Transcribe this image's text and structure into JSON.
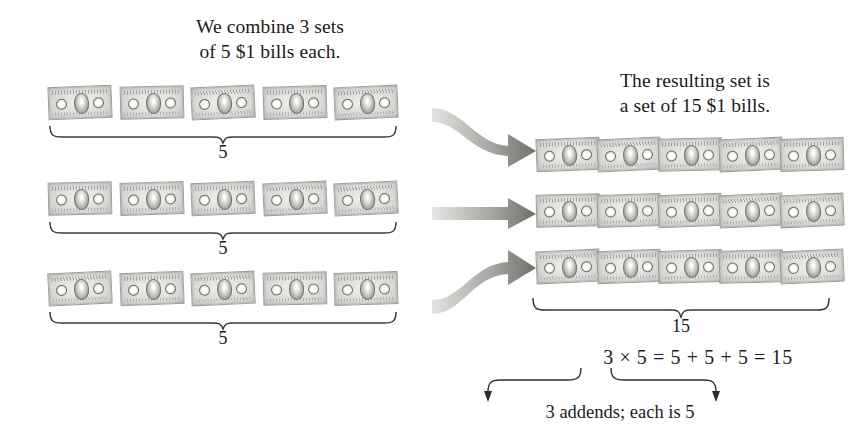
{
  "background_color": "#ffffff",
  "text_color": "#1b1b1b",
  "captions": {
    "left": "We combine 3 sets\nof 5 $1 bills each.",
    "right": "The resulting set is\na set of 15 $1 bills."
  },
  "left_group": {
    "rows": [
      {
        "bill_count": 5,
        "brace_label": "5"
      },
      {
        "bill_count": 5,
        "brace_label": "5"
      },
      {
        "bill_count": 5,
        "brace_label": "5"
      }
    ]
  },
  "right_group": {
    "rows": [
      {
        "bill_count": 5
      },
      {
        "bill_count": 5
      },
      {
        "bill_count": 5
      }
    ],
    "brace_label": "15"
  },
  "arrows": [
    {
      "name": "arrow-row-1",
      "shape": "curve-down"
    },
    {
      "name": "arrow-row-2",
      "shape": "straight"
    },
    {
      "name": "arrow-row-3",
      "shape": "curve-up"
    }
  ],
  "equation": "3 × 5 = 5 + 5 + 5 = 15",
  "annotation": "3 addends; each is 5",
  "bill_denomination": "$1",
  "icons": {
    "bill": "dollar-bill-icon",
    "arrow": "thick-arrow-icon",
    "brace": "curly-brace-icon",
    "pointer": "elbow-arrow-icon"
  }
}
